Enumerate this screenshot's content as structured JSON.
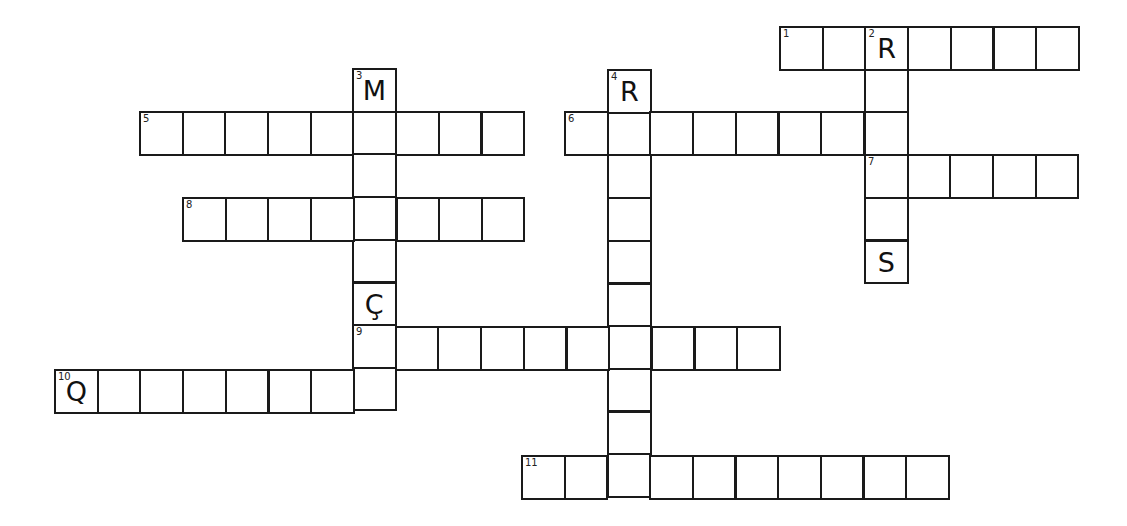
{
  "puzzle": {
    "type": "crossword",
    "cell_size": 42.7,
    "clues": [
      {
        "number": "1",
        "direction": "across",
        "length": 7,
        "start": {
          "x": 780,
          "y": 27
        }
      },
      {
        "number": "2",
        "direction": "down",
        "length": 6,
        "start": {
          "x": 865,
          "y": 27
        }
      },
      {
        "number": "3",
        "direction": "down",
        "length": 8,
        "start": {
          "x": 353,
          "y": 69
        }
      },
      {
        "number": "4",
        "direction": "down",
        "length": 10,
        "start": {
          "x": 608,
          "y": 70
        }
      },
      {
        "number": "5",
        "direction": "across",
        "length": 9,
        "start": {
          "x": 140,
          "y": 112
        }
      },
      {
        "number": "6",
        "direction": "across",
        "length": 8,
        "start": {
          "x": 565,
          "y": 112
        }
      },
      {
        "number": "7",
        "direction": "across",
        "length": 5,
        "start": {
          "x": 865,
          "y": 155
        }
      },
      {
        "number": "8",
        "direction": "across",
        "length": 8,
        "start": {
          "x": 183,
          "y": 198
        }
      },
      {
        "number": "9",
        "direction": "across",
        "length": 10,
        "start": {
          "x": 353,
          "y": 327
        }
      },
      {
        "number": "10",
        "direction": "across",
        "length": 8,
        "start": {
          "x": 55,
          "y": 370
        }
      },
      {
        "number": "11",
        "direction": "across",
        "length": 10,
        "start": {
          "x": 522,
          "y": 456
        }
      }
    ],
    "given_letters": [
      {
        "x": 865,
        "y": 27,
        "letter": "R"
      },
      {
        "x": 353,
        "y": 69,
        "letter": "M"
      },
      {
        "x": 608,
        "y": 70,
        "letter": "R"
      },
      {
        "x": 865,
        "y": 241,
        "letter": "S"
      },
      {
        "x": 353,
        "y": 284,
        "letter": "Ç"
      },
      {
        "x": 55,
        "y": 370,
        "letter": "Q"
      }
    ]
  }
}
